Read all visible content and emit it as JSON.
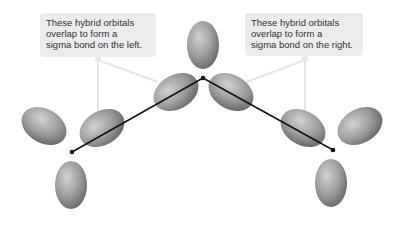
{
  "callouts": {
    "left": {
      "lines": [
        "These hybrid orbitals",
        "overlap to form a",
        "sigma bond on the left."
      ]
    },
    "right": {
      "lines": [
        "These hybrid orbitals",
        "overlap to form a",
        "sigma bond on the right."
      ]
    }
  },
  "diagram": {
    "atoms": [
      {
        "name": "left-atom",
        "x": 72,
        "y": 152
      },
      {
        "name": "center-atom",
        "x": 203,
        "y": 78
      },
      {
        "name": "right-atom",
        "x": 333,
        "y": 150
      }
    ],
    "colors": {
      "orbital_light": "#c8c8c8",
      "orbital_dark": "#6a6a6a",
      "bond_line": "#111111",
      "callout_bg": "#ececec",
      "leader_line": "#e6e6e6"
    }
  }
}
